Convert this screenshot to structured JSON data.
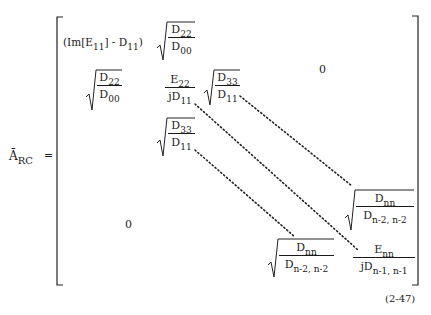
{
  "equation": {
    "lhs": {
      "symbol": "Ā",
      "subscript": "RC",
      "equals": "="
    },
    "number": "(2-47)",
    "cells": {
      "r1c1": {
        "text": "(Im[E",
        "sub1": "11",
        "mid": "] - D",
        "sub2": "11",
        "close": ")"
      },
      "r1c2": {
        "num": "D",
        "num_sub": "22",
        "den": "D",
        "den_sub": "00"
      },
      "r2c1": {
        "num": "D",
        "num_sub": "22",
        "den": "D",
        "den_sub": "00"
      },
      "r2c2": {
        "num": "E",
        "num_sub": "22",
        "den": "jD",
        "den_sub": "11"
      },
      "r2c3": {
        "num": "D",
        "num_sub": "33",
        "den": "D",
        "den_sub": "11"
      },
      "r3c2": {
        "num": "D",
        "num_sub": "33",
        "den": "D",
        "den_sub": "11"
      },
      "upper_zero": "0",
      "lower_zero": "0",
      "rn1": {
        "num": "D",
        "num_sub": "nn",
        "den": "D",
        "den_sub": "n-2, n-2"
      },
      "rn2": {
        "num": "D",
        "num_sub": "nn",
        "den": "D",
        "den_sub": "n-2, n-2"
      },
      "rn3": {
        "num": "E",
        "num_sub": "nn",
        "den": "jD",
        "den_sub": "n-1, n-1"
      }
    }
  }
}
